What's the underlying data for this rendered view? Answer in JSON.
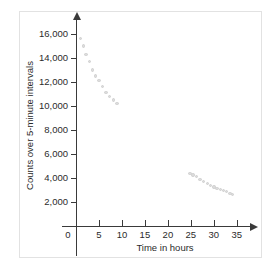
{
  "chart_data": {
    "type": "scatter",
    "title": "",
    "xlabel": "Time in hours",
    "ylabel": "Counts over 5-minute intervals",
    "xlim": [
      0,
      37
    ],
    "ylim": [
      0,
      17000
    ],
    "xticks": [
      0,
      5,
      10,
      15,
      20,
      25,
      30,
      35
    ],
    "xtick_labels": [
      "0",
      "5",
      "10",
      "15",
      "20",
      "25",
      "30",
      "35"
    ],
    "yticks": [
      2000,
      4000,
      6000,
      8000,
      10000,
      12000,
      14000,
      16000
    ],
    "ytick_labels": [
      "2,000",
      "4,000",
      "6,000",
      "8,000",
      "10,000",
      "12,000",
      "14,000",
      "16,000"
    ],
    "grid": false,
    "legend": null,
    "marker_color": "#dcdcdc",
    "axis_color": "#3a3a3a",
    "series": [
      {
        "name": "Counts",
        "points": [
          [
            1.0,
            15600
          ],
          [
            1.6,
            15000
          ],
          [
            2.2,
            14300
          ],
          [
            2.9,
            13700
          ],
          [
            3.6,
            13000
          ],
          [
            4.3,
            12500
          ],
          [
            5.0,
            12100
          ],
          [
            5.8,
            11600
          ],
          [
            6.5,
            11100
          ],
          [
            7.3,
            10800
          ],
          [
            8.1,
            10500
          ],
          [
            8.9,
            10200
          ],
          [
            24.8,
            4400
          ],
          [
            25.5,
            4250
          ],
          [
            26.2,
            4100
          ],
          [
            27.0,
            3900
          ],
          [
            27.8,
            3700
          ],
          [
            28.6,
            3550
          ],
          [
            29.3,
            3400
          ],
          [
            30.0,
            3250
          ],
          [
            30.7,
            3150
          ],
          [
            31.4,
            3050
          ],
          [
            32.1,
            2950
          ],
          [
            32.8,
            2850
          ],
          [
            33.5,
            2720
          ],
          [
            34.1,
            2620
          ]
        ]
      }
    ]
  }
}
